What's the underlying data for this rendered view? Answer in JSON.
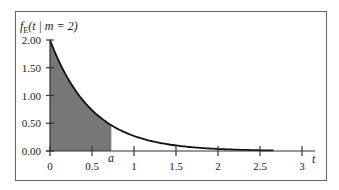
{
  "chart_data": {
    "type": "area",
    "title": "",
    "ylabel": "f_E(t | m = 2)",
    "ylabel_parts": {
      "f": "f",
      "sub": "E",
      "rest": "(t | m = 2)"
    },
    "xlabel": "t",
    "function": "f(t) = 2·e^(−2t)",
    "rate_m": 2,
    "xlim": [
      0,
      3
    ],
    "ylim": [
      0,
      2
    ],
    "x_ticks": [
      0,
      0.5,
      1,
      1.5,
      2,
      2.5,
      3
    ],
    "x_tick_labels": [
      "0",
      "0.5",
      "1",
      "1.5",
      "2",
      "2.5",
      "3"
    ],
    "y_ticks": [
      0,
      0.5,
      1,
      1.5,
      2
    ],
    "y_tick_labels": [
      "0.00",
      "0.50",
      "1.00",
      "1.50",
      "2.00"
    ],
    "curve_end_t": 2.67,
    "shaded_region": {
      "from": 0,
      "to": 0.73,
      "label": "a"
    },
    "annotation": "a",
    "grid": false,
    "colors": {
      "fill": "#777777",
      "line": "#111111",
      "frame": "#555555"
    },
    "sample_points": [
      {
        "t": 0,
        "y": 2.0
      },
      {
        "t": 0.25,
        "y": 1.21
      },
      {
        "t": 0.5,
        "y": 0.74
      },
      {
        "t": 0.73,
        "y": 0.46
      },
      {
        "t": 1.0,
        "y": 0.27
      },
      {
        "t": 1.5,
        "y": 0.1
      },
      {
        "t": 2.0,
        "y": 0.04
      },
      {
        "t": 2.5,
        "y": 0.01
      }
    ]
  }
}
